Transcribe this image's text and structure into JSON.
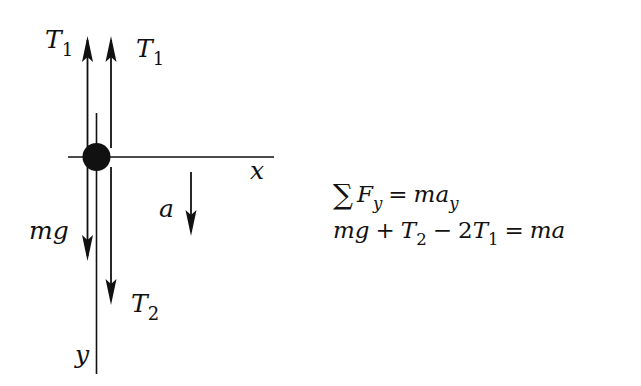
{
  "diagram": {
    "type": "free-body-diagram",
    "axes": {
      "x_label": "x",
      "y_label": "y"
    },
    "forces": [
      {
        "id": "T1_left",
        "symbol": "T",
        "subscript": "1",
        "direction": "up"
      },
      {
        "id": "T1_right",
        "symbol": "T",
        "subscript": "1",
        "direction": "up"
      },
      {
        "id": "mg",
        "symbol": "mg",
        "subscript": "",
        "direction": "down"
      },
      {
        "id": "T2",
        "symbol": "T",
        "subscript": "2",
        "direction": "down"
      }
    ],
    "acceleration": {
      "symbol": "a",
      "direction": "down"
    },
    "colors": {
      "ink": "#111111",
      "background": "#ffffff"
    }
  },
  "labels": {
    "t1_left": {
      "base": "T",
      "sub": "1"
    },
    "t1_right": {
      "base": "T",
      "sub": "1"
    },
    "mg": "mg",
    "t2": {
      "base": "T",
      "sub": "2"
    },
    "a": "a",
    "x": "x",
    "y": "y"
  },
  "equations": {
    "line1": {
      "sigma": "∑",
      "lhs_base": "F",
      "lhs_sub": "y",
      "equals": "=",
      "rhs_base": "ma",
      "rhs_sub": "y"
    },
    "line2": {
      "term1": "mg",
      "plus": "+",
      "term2_base": "T",
      "term2_sub": "2",
      "minus": "−",
      "coef": "2",
      "term3_base": "T",
      "term3_sub": "1",
      "equals": "=",
      "rhs": "ma"
    }
  }
}
